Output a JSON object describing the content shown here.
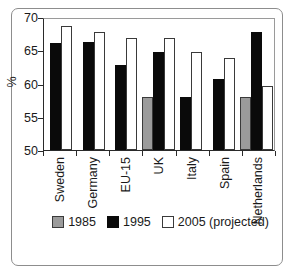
{
  "chart_data": {
    "type": "bar",
    "title": "",
    "subtitle": "",
    "xlabel": "",
    "ylabel": "%",
    "ylim": [
      50,
      70
    ],
    "yticks": [
      50,
      55,
      60,
      65,
      70
    ],
    "ytick_labels": [
      "50",
      "55",
      "60",
      "65",
      "70"
    ],
    "grid": false,
    "legend_position": "bottom",
    "categories": [
      "Sweden",
      "Germany",
      "EU-15",
      "UK",
      "Italy",
      "Spain",
      "Netherlands"
    ],
    "series": [
      {
        "name": "1985",
        "color": "#9b9b9b",
        "values": [
          null,
          null,
          null,
          58.0,
          null,
          null,
          58.0
        ]
      },
      {
        "name": "1995",
        "color": "#0a0a0a",
        "values": [
          66.1,
          66.2,
          62.8,
          64.8,
          58.0,
          60.7,
          67.7
        ]
      },
      {
        "name": "2005 (projected)",
        "color": "#ffffff",
        "values": [
          68.6,
          67.7,
          66.9,
          66.9,
          64.8,
          63.9,
          59.6
        ]
      }
    ]
  },
  "legend": {
    "items": [
      {
        "label": "1985",
        "key": "y1985"
      },
      {
        "label": "1995",
        "key": "y1995"
      },
      {
        "label": "2005 (projected)",
        "key": "y2005"
      }
    ]
  },
  "axis": {
    "y_label": "%",
    "y_tick_labels": [
      "70",
      "65",
      "60",
      "55",
      "50"
    ]
  }
}
